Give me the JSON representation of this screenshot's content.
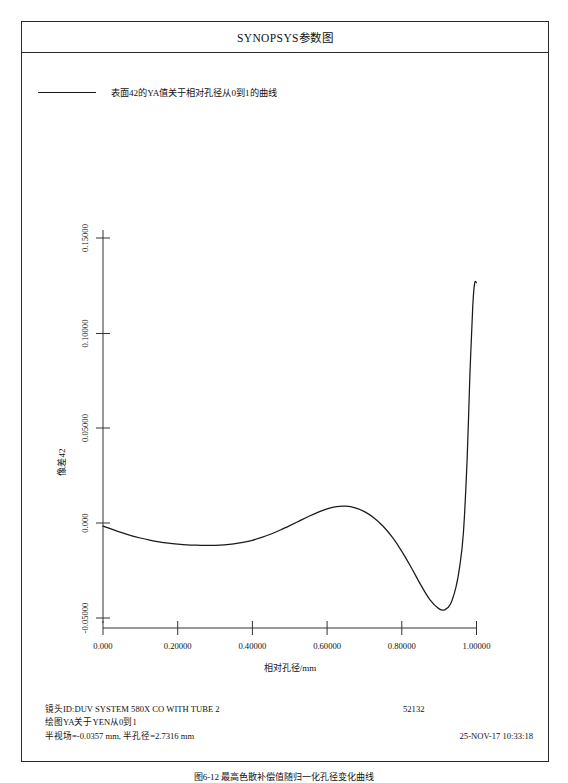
{
  "window": {
    "title": "SYNOPSYS参数图"
  },
  "legend": {
    "label": "表面42的YA值关于相对孔径从0到1的曲线",
    "line_color": "#1a1a1a"
  },
  "axes": {
    "y_label": "像差42",
    "x_label": "相对孔径/mm",
    "y_ticks": [
      "0.15000",
      "0.10000",
      "0.05000",
      "0.000",
      "-0.05000"
    ],
    "x_ticks": [
      "0.000",
      "0.20000",
      "0.40000",
      "0.60000",
      "0.80000",
      "1.00000"
    ]
  },
  "footer": {
    "lens_id": "镜头ID:DUV  SYSTEM  580X CO WITH TUBE 2",
    "plot_desc": "绘图YA关于YEN从0到1",
    "field_info": "半视场=-0.0357 mm, 半孔径=2.7316 mm",
    "code": "52132",
    "timestamp": "25-NOV-17  10:33:18"
  },
  "caption": {
    "text": "图6-12  最高色散补偿值随归一化孔径变化曲线"
  },
  "chart_data": {
    "type": "line",
    "title": "SYNOPSYS参数图",
    "xlabel": "相对孔径/mm",
    "ylabel": "像差42",
    "xlim": [
      0.0,
      1.0
    ],
    "ylim": [
      -0.0625,
      0.165
    ],
    "grid": false,
    "legend_position": "top-left",
    "series": [
      {
        "name": "表面42的YA值关于相对孔径从0到1的曲线",
        "color": "#1a1a1a",
        "x": [
          0.0,
          0.025,
          0.05,
          0.075,
          0.1,
          0.125,
          0.15,
          0.175,
          0.2,
          0.225,
          0.25,
          0.275,
          0.3,
          0.325,
          0.35,
          0.375,
          0.4,
          0.425,
          0.45,
          0.475,
          0.5,
          0.525,
          0.55,
          0.575,
          0.6,
          0.625,
          0.65,
          0.675,
          0.7,
          0.725,
          0.75,
          0.775,
          0.8,
          0.825,
          0.85,
          0.875,
          0.9,
          0.915,
          0.93,
          0.945,
          0.955,
          0.965,
          0.975,
          0.982,
          0.99,
          0.995,
          1.0
        ],
        "y": [
          -0.0016,
          -0.0034,
          -0.0051,
          -0.0066,
          -0.0079,
          -0.009,
          -0.0099,
          -0.0106,
          -0.0111,
          -0.0115,
          -0.0117,
          -0.0118,
          -0.01175,
          -0.0115,
          -0.011,
          -0.0102,
          -0.0091,
          -0.0076,
          -0.0058,
          -0.0037,
          -0.0014,
          0.001,
          0.0034,
          0.0056,
          0.0074,
          0.00865,
          0.00885,
          0.008,
          0.006,
          0.0028,
          -0.0017,
          -0.0076,
          -0.0149,
          -0.0233,
          -0.0323,
          -0.0403,
          -0.0452,
          -0.0457,
          -0.0428,
          -0.0337,
          -0.023,
          -0.005,
          0.034,
          0.076,
          0.114,
          0.1262,
          0.1265
        ],
        "markers": false
      }
    ],
    "annotations": [
      {
        "label": "local-minimum",
        "x": 0.845,
        "y": -0.0459
      },
      {
        "label": "local-maximum",
        "x": 0.632,
        "y": 0.0089
      },
      {
        "label": "global-maximum",
        "x": 0.975,
        "y": 0.1265
      },
      {
        "label": "curve-end",
        "x": 1.0,
        "y": 0.031
      }
    ]
  }
}
